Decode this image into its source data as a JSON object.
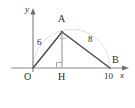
{
  "figure": {
    "type": "geometry-diagram",
    "stroke_color": "#4d4d4d",
    "light_stroke_color": "#b0b0b0",
    "text_color": "#2b2b2b",
    "background": "#ffffff"
  },
  "axes": {
    "x_label": "x",
    "y_label": "y",
    "origin_label": "O"
  },
  "points": [
    {
      "name": "A",
      "label": "A",
      "x": 62,
      "y": 32
    },
    {
      "name": "B",
      "label": "B",
      "x": 110,
      "y": 68
    },
    {
      "name": "H",
      "label": "H",
      "x": 62,
      "y": 68
    },
    {
      "name": "O",
      "label": "O",
      "x": 33,
      "y": 68
    }
  ],
  "segment_labels": [
    {
      "name": "OA",
      "label": "6"
    },
    {
      "name": "AB",
      "label": "8"
    }
  ],
  "axis_ticks": [
    {
      "name": "x-tick-10",
      "label": "10",
      "value": "10"
    }
  ],
  "markers": {
    "right_angle_at_H": "right-angle-square",
    "right_angle_at_A": "angle-arc"
  }
}
